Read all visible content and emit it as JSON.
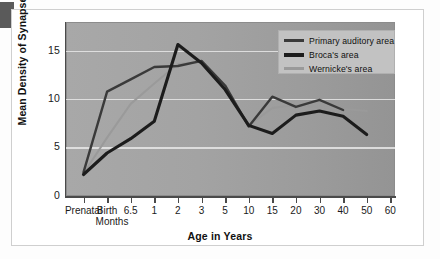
{
  "chart_data": {
    "type": "line",
    "title": "",
    "xlabel": "Age in Years",
    "ylabel": "Mean Density of Synapses",
    "categories": [
      "Prenatal",
      "Birth",
      "6.5 Months",
      "1",
      "2",
      "3",
      "5",
      "10",
      "15",
      "20",
      "30",
      "40",
      "50",
      "60"
    ],
    "xtick_labels": [
      "Prenatal",
      "Birth",
      "6.5",
      "1",
      "2",
      "3",
      "5",
      "10",
      "15",
      "20",
      "30",
      "40",
      "50",
      "60"
    ],
    "xtick_sublabel": "Months",
    "ytick_labels": [
      "0",
      "5",
      "10",
      "15"
    ],
    "ylim": [
      0,
      17
    ],
    "yticks": [
      0,
      5,
      10,
      15
    ],
    "grid": "horizontal",
    "legend_position": "top-right",
    "series": [
      {
        "name": "Primary auditory area",
        "color": "#3a3a3a",
        "width": 2.4,
        "x": [
          "Prenatal",
          "Birth",
          "6.5",
          "1",
          "2",
          "3",
          "5",
          "10",
          "15",
          "20",
          "30",
          "40"
        ],
        "values": [
          2.3,
          10.2,
          11.4,
          12.6,
          12.7,
          13.2,
          10.8,
          6.8,
          9.7,
          8.7,
          9.4,
          8.4
        ]
      },
      {
        "name": "Broca's area",
        "color": "#1c1c1c",
        "width": 3.1,
        "x": [
          "Prenatal",
          "Birth",
          "6.5",
          "1",
          "2",
          "3",
          "5",
          "10",
          "15",
          "20",
          "30",
          "40",
          "50"
        ],
        "values": [
          2.1,
          4.2,
          5.6,
          7.3,
          14.8,
          13.0,
          10.4,
          6.9,
          6.1,
          7.9,
          8.3,
          7.8,
          6.0
        ]
      },
      {
        "name": "Wernicke's area",
        "color": "#9a9a9a",
        "width": 2.0,
        "x": [
          "Prenatal",
          "Birth",
          "6.5",
          "1",
          "2",
          "3",
          "5",
          "10",
          "15",
          "20",
          "30",
          "40",
          "50"
        ],
        "values": [
          2.2,
          5.7,
          9.0,
          11.0,
          12.9,
          13.1,
          10.6,
          6.9,
          8.6,
          8.9,
          8.7,
          8.5,
          8.3
        ]
      }
    ]
  },
  "legend": {
    "items": [
      {
        "label": "Primary auditory area",
        "color": "#3a3a3a",
        "width": 3
      },
      {
        "label": "Broca's area",
        "color": "#1c1c1c",
        "width": 4
      },
      {
        "label": "Wernicke's area",
        "color": "#9a9a9a",
        "width": 3
      }
    ]
  },
  "axes": {
    "y_title": "Mean Density of Synapses",
    "x_title": "Age in Years"
  },
  "colors": {
    "plot_background": "#a3a3a3",
    "gridline": "#e8e8e8",
    "axis": "#4a4a4a",
    "legend_background": "#c2c2c2",
    "page_background": "#ffffff",
    "corner_block": "#5a5a5a"
  }
}
